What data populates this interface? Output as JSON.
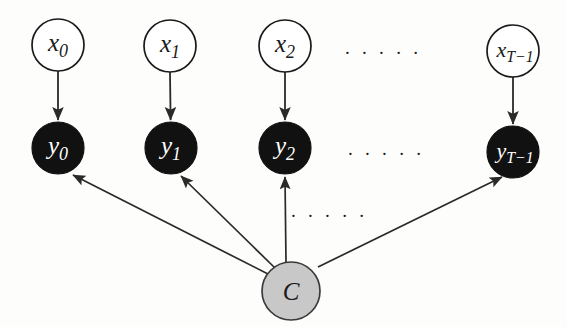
{
  "figure": {
    "kind": "probabilistic-graphical-model",
    "width": 567,
    "height": 327,
    "background_color": "#fdfdfc"
  },
  "colors": {
    "observed_node_fill": "#111111",
    "observed_node_text": "#ffffff",
    "latent_node_fill": "#ffffff",
    "latent_node_stroke": "#1a1a1a",
    "shared_node_fill": "#c8c8c8",
    "shared_node_stroke": "#3a3a3a",
    "edge_color": "#2a2a2a"
  },
  "nodes": {
    "inputs": [
      {
        "id": "x0",
        "base": "x",
        "sub": "0",
        "cx": 58,
        "cy": 45,
        "r": 26
      },
      {
        "id": "x1",
        "base": "x",
        "sub": "1",
        "cx": 170,
        "cy": 46,
        "r": 26
      },
      {
        "id": "x2",
        "base": "x",
        "sub": "2",
        "cx": 285,
        "cy": 46,
        "r": 26
      },
      {
        "id": "xT-1",
        "base": "x",
        "sub": "T−1",
        "cx": 513,
        "cy": 51,
        "r": 26
      }
    ],
    "outputs": [
      {
        "id": "y0",
        "base": "y",
        "sub": "0",
        "cx": 58,
        "cy": 148,
        "r": 26
      },
      {
        "id": "y1",
        "base": "y",
        "sub": "1",
        "cx": 171,
        "cy": 148,
        "r": 26
      },
      {
        "id": "y2",
        "base": "y",
        "sub": "2",
        "cx": 285,
        "cy": 148,
        "r": 26
      },
      {
        "id": "yT-1",
        "base": "y",
        "sub": "T−1",
        "cx": 513,
        "cy": 152,
        "r": 26
      }
    ],
    "shared": {
      "id": "C",
      "label": "C",
      "cx": 291,
      "cy": 291,
      "r": 29
    }
  },
  "edges": [
    {
      "from": "x0",
      "to": "y0"
    },
    {
      "from": "x1",
      "to": "y1"
    },
    {
      "from": "x2",
      "to": "y2"
    },
    {
      "from": "xT-1",
      "to": "yT-1"
    },
    {
      "from": "C",
      "to": "y0"
    },
    {
      "from": "C",
      "to": "y1"
    },
    {
      "from": "C",
      "to": "y2"
    },
    {
      "from": "C",
      "to": "yT-1"
    }
  ],
  "ellipses": [
    {
      "id": "ellipsis-top",
      "text": "· · · · ·",
      "cx": 383,
      "cy": 52
    },
    {
      "id": "ellipsis-middle",
      "text": "· · · · ·",
      "cx": 386,
      "cy": 153
    },
    {
      "id": "ellipsis-lower",
      "text": "· · · · ·",
      "cx": 329,
      "cy": 215
    }
  ]
}
